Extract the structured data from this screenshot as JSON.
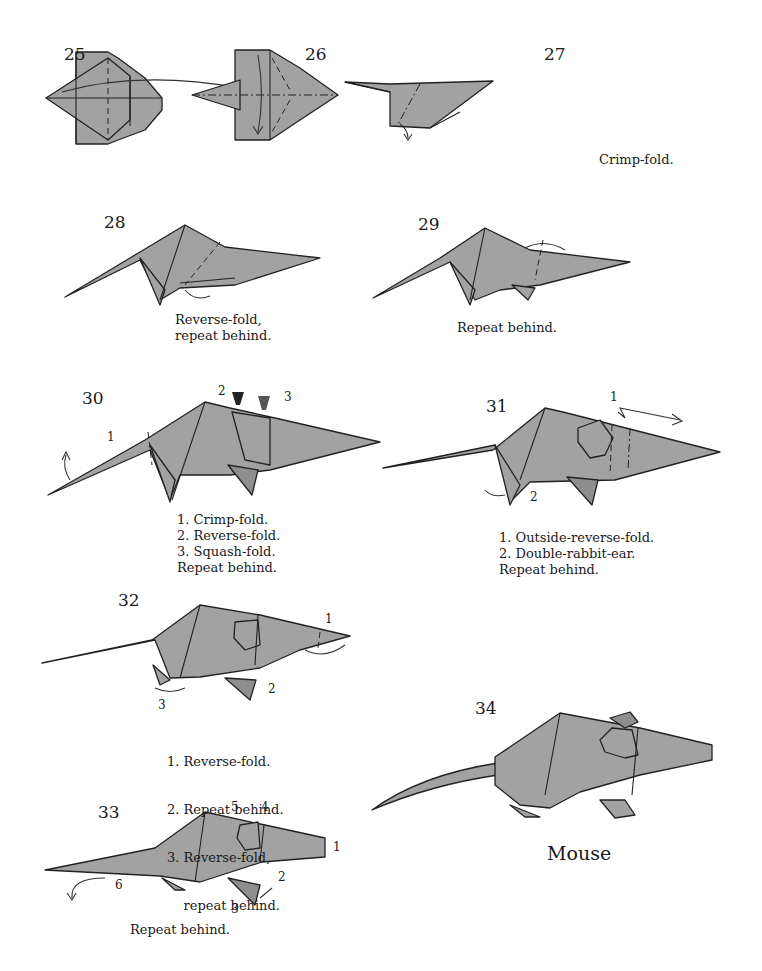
{
  "page": {
    "fill_color": "#a2a2a2",
    "line_color": "#222222",
    "background": "#ffffff"
  },
  "steps": [
    {
      "number": "25",
      "caption": []
    },
    {
      "number": "26",
      "caption": []
    },
    {
      "number": "27",
      "caption": [
        "Crimp-fold."
      ]
    },
    {
      "number": "28",
      "caption": [
        "Reverse-fold,",
        "repeat behind."
      ]
    },
    {
      "number": "29",
      "caption": [
        "Repeat behind."
      ]
    },
    {
      "number": "30",
      "caption": [
        "1. Crimp-fold.",
        "2. Reverse-fold.",
        "3. Squash-fold.",
        "Repeat behind."
      ],
      "markers": [
        "1",
        "2",
        "3"
      ]
    },
    {
      "number": "31",
      "caption": [
        "1. Outside-reverse-fold.",
        "2. Double-rabbit-ear.",
        "Repeat behind."
      ],
      "markers": [
        "1",
        "2"
      ]
    },
    {
      "number": "32",
      "caption": [
        "1. Reverse-fold.",
        "2. Repeat behind.",
        "3. Reverse-fold,",
        "    repeat behind."
      ],
      "markers": [
        "1",
        "2",
        "3"
      ]
    },
    {
      "number": "33",
      "caption": [
        "Repeat behind."
      ],
      "markers": [
        "1",
        "2",
        "3",
        "4",
        "5",
        "6"
      ]
    },
    {
      "number": "34",
      "caption": [],
      "title": "Mouse"
    }
  ]
}
